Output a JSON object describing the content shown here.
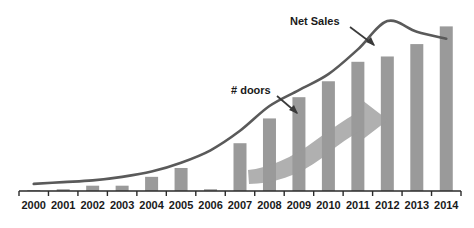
{
  "chart_data": {
    "type": "bar",
    "title": "",
    "subtitle": "",
    "xlabel": "",
    "ylabel": "",
    "grid": false,
    "legend_position": "none",
    "axis": {
      "x_axis_visible": true,
      "y_axis_visible": false,
      "tick_marks": "below-axis, between category labels",
      "ylim": [
        0,
        100
      ]
    },
    "categories": [
      "2000",
      "2001",
      "2002",
      "2003",
      "2004",
      "2005",
      "2006",
      "2007",
      "2008",
      "2009",
      "2010",
      "2011",
      "2012",
      "2013",
      "2014"
    ],
    "series": [
      {
        "name": "# doors",
        "type": "bar",
        "color": "#9a9a9a",
        "values": [
          0,
          1,
          3,
          3,
          8,
          13,
          1,
          27,
          41,
          53,
          62,
          73,
          76,
          83,
          93
        ]
      },
      {
        "name": "Net Sales",
        "type": "line",
        "color": "#5a5a5a",
        "values": [
          4,
          5,
          6,
          8,
          11,
          16,
          23,
          34,
          48,
          57,
          66,
          80,
          96,
          90,
          86
        ]
      }
    ],
    "annotations": [
      {
        "id": "net-sales-annotation",
        "label": "Net Sales",
        "points_to": "Net Sales line",
        "arrow": "down-right"
      },
      {
        "id": "doors-annotation",
        "label": "# doors",
        "points_to": "bar series",
        "arrow": "down-right"
      },
      {
        "id": "growth-arrow",
        "label": "",
        "shape": "thick upward curved arrow sweeping across the bars",
        "color": "#9a9a9a"
      }
    ]
  },
  "colors": {
    "bar": "#9a9a9a",
    "line": "#5a5a5a",
    "axis": "#2a2a2a",
    "text": "#1a1a1a",
    "background": "#ffffff",
    "overlay_arrow": "#9a9a9a"
  }
}
